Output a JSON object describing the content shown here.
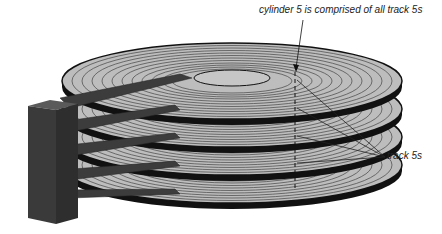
{
  "diagram": {
    "type": "disk-platter-stack",
    "platter_count": 4,
    "labels": {
      "cylinder": "cylinder 5 is comprised of all track 5s",
      "tracks": "track 5s"
    },
    "colors": {
      "platter_fill": "#bdbdbd",
      "platter_edge": "#111111",
      "track_line": "#444444",
      "actuator": "#3c3c3c",
      "arm": "#4a4a4a",
      "background": "#ffffff"
    }
  }
}
